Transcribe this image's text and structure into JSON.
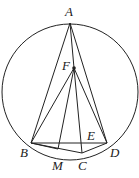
{
  "diagram": {
    "type": "geometry",
    "circle": {
      "cx": 70,
      "cy": 92,
      "r": 68
    },
    "points": {
      "A": {
        "label": "A",
        "x": 70,
        "y": 23
      },
      "F": {
        "label": "F",
        "x": 74,
        "y": 68
      },
      "B": {
        "label": "B",
        "x": 31,
        "y": 143
      },
      "D": {
        "label": "D",
        "x": 107,
        "y": 143
      },
      "C": {
        "label": "C",
        "x": 82,
        "y": 153
      },
      "M": {
        "label": "M",
        "x": 58,
        "y": 149
      },
      "E": {
        "label": "E",
        "x": 82,
        "y": 143
      }
    },
    "segments": [
      "AB",
      "AF",
      "AD",
      "FB",
      "FM",
      "FC",
      "FD",
      "BD",
      "BC",
      "CD",
      "BM"
    ]
  }
}
